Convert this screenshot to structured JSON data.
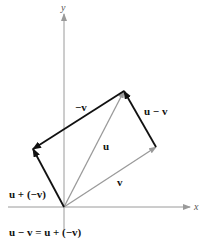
{
  "diagram": {
    "type": "vector-subtraction",
    "axes": {
      "x_label": "x",
      "y_label": "y",
      "color": "#9a9a9a"
    },
    "vectors": [
      {
        "name": "u",
        "label": "u",
        "from": [
          64,
          207
        ],
        "to": [
          124,
          91
        ],
        "color": "#9a9a9a"
      },
      {
        "name": "v",
        "label": "v",
        "from": [
          64,
          207
        ],
        "to": [
          156,
          147
        ],
        "color": "#9a9a9a"
      },
      {
        "name": "neg-v",
        "label": "−v",
        "from": [
          124,
          91
        ],
        "to": [
          33,
          149
        ],
        "color": "#111111"
      },
      {
        "name": "u-minus-v",
        "label": "u − v",
        "from": [
          156,
          147
        ],
        "to": [
          124,
          91
        ],
        "color": "#111111"
      },
      {
        "name": "u-plus-neg-v",
        "label": "u + (−v)",
        "from": [
          64,
          207
        ],
        "to": [
          33,
          149
        ],
        "color": "#111111"
      }
    ],
    "labels": {
      "neg_v": "−v",
      "u_minus_v": "u − v",
      "u": "u",
      "v": "v",
      "u_plus_neg_v": "u + (−v)"
    },
    "equation": "u − v = u + (−v)"
  }
}
